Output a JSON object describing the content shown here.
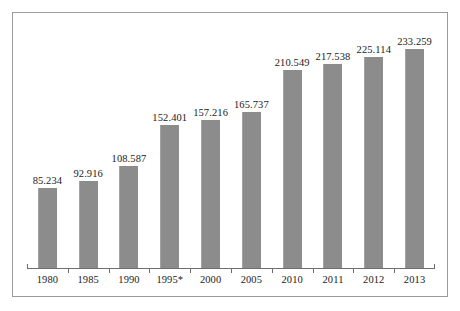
{
  "chart_data": {
    "type": "bar",
    "title": "",
    "subtitle": "",
    "xlabel": "",
    "ylabel": "",
    "grid": false,
    "legend": "none",
    "ylim": [
      0,
      233.259
    ],
    "categories": [
      "1980",
      "1985",
      "1990",
      "1995*",
      "2000",
      "2005",
      "2010",
      "2011",
      "2012",
      "2013"
    ],
    "values": [
      85.234,
      92.916,
      108.587,
      152.401,
      157.216,
      165.737,
      210.549,
      217.538,
      225.114,
      233.259
    ],
    "value_labels": [
      "85.234",
      "92.916",
      "108.587",
      "152.401",
      "157.216",
      "165.737",
      "210.549",
      "217.538",
      "225.114",
      "233.259"
    ],
    "series": [
      {
        "name": "",
        "values": [
          85.234,
          92.916,
          108.587,
          152.401,
          157.216,
          165.737,
          210.549,
          217.538,
          225.114,
          233.259
        ],
        "color": "#8c8c8c"
      }
    ],
    "annotations": [
      "*"
    ],
    "bar_color": "#8c8c8c",
    "frame_color": "#9a9a9a",
    "axis_color": "#6f6f6f",
    "label_color": "#1a1a1a",
    "background": "#ffffff"
  }
}
